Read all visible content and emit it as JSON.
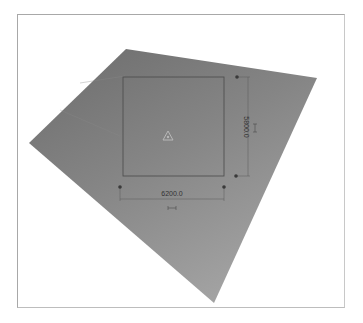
{
  "viewport": {
    "background": "#ffffff",
    "border_color": "#a8a8a8"
  },
  "surface": {
    "name": "sloped-floor-surface",
    "color_top": "#6e6e6e",
    "color_bottom": "#9a9a9a",
    "corners": {
      "top": [
        126,
        49
      ],
      "right": [
        317,
        78
      ],
      "bottom": [
        214,
        303
      ],
      "left": [
        29,
        143
      ]
    }
  },
  "selection": {
    "rect": {
      "x": 123,
      "y": 77,
      "width": 101,
      "height": 99
    },
    "outline_color": "#4a4a4a",
    "center_icon": "triangle-origin-icon"
  },
  "dimensions": {
    "horizontal": {
      "value": "6200.0",
      "lock_icon": "dimension-lock-icon"
    },
    "vertical": {
      "value": "5800.0",
      "lock_icon": "dimension-lock-icon"
    }
  },
  "grips": [
    {
      "x": 120,
      "y": 187
    },
    {
      "x": 224,
      "y": 187
    },
    {
      "x": 237,
      "y": 77
    },
    {
      "x": 236,
      "y": 176
    }
  ]
}
